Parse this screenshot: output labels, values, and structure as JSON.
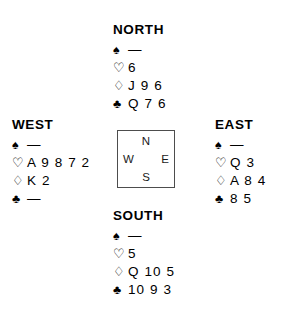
{
  "suits": {
    "spade": "♠",
    "heart": "♡",
    "diamond": "♢",
    "club": "♣",
    "void": "—"
  },
  "compass": {
    "north": "N",
    "west": "W",
    "east": "E",
    "south": "S"
  },
  "hands": {
    "north": {
      "label": "NORTH",
      "spades": "—",
      "hearts": "6",
      "diamonds": "J 9 6",
      "clubs": "Q 7 6"
    },
    "west": {
      "label": "WEST",
      "spades": "—",
      "hearts": "A 9 8 7 2",
      "diamonds": "K 2",
      "clubs": "—"
    },
    "east": {
      "label": "EAST",
      "spades": "—",
      "hearts": "Q 3",
      "diamonds": "A 8 4",
      "clubs": "8 5"
    },
    "south": {
      "label": "SOUTH",
      "spades": "—",
      "hearts": "5",
      "diamonds": "Q 10 5",
      "clubs": "10 9 3"
    }
  }
}
